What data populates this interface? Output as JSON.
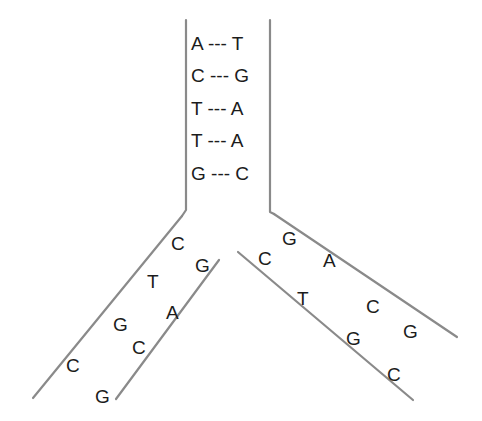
{
  "diagram": {
    "colors": {
      "strand": "#8a8a8a",
      "text": "#1c1c1c",
      "background": "#ffffff"
    },
    "parent_pairs": [
      {
        "left": "A",
        "bond": "---",
        "right": "T",
        "label": "A --- T"
      },
      {
        "left": "C",
        "bond": "---",
        "right": "G",
        "label": "C --- G"
      },
      {
        "left": "T",
        "bond": "---",
        "right": "A",
        "label": "T --- A"
      },
      {
        "left": "T",
        "bond": "---",
        "right": "A",
        "label": "T --- A"
      },
      {
        "left": "G",
        "bond": "---",
        "right": "C",
        "label": "G --- C"
      }
    ],
    "left_arm": {
      "outer_strand_bases": [
        "C",
        "T",
        "G",
        "C"
      ],
      "inner_strand_bases": [
        "G",
        "A",
        "C",
        "G"
      ]
    },
    "right_arm": {
      "outer_strand_bases": [
        "G",
        "A",
        "C",
        "G"
      ],
      "inner_strand_bases": [
        "C",
        "T",
        "G",
        "C"
      ]
    }
  }
}
